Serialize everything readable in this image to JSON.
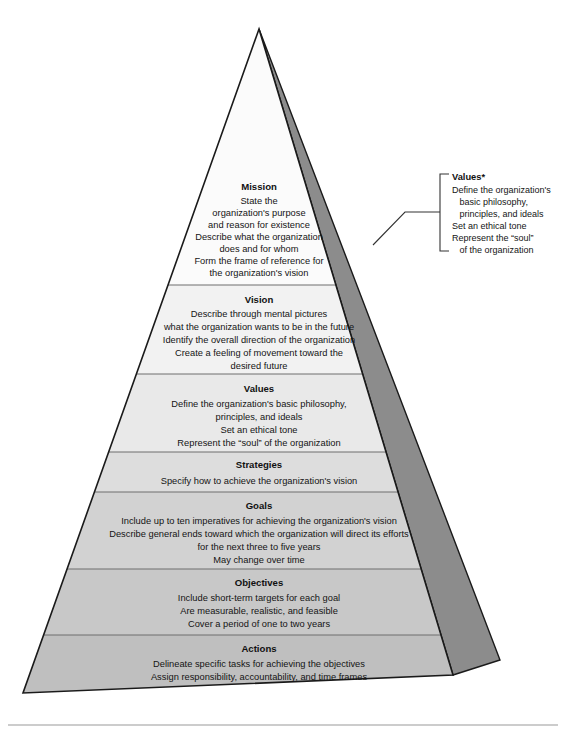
{
  "diagram": {
    "apex": "",
    "bands": [
      {
        "id": "mission",
        "title": "Mission",
        "lines": [
          "State the",
          "organization's purpose",
          "and reason for existence",
          "Describe what the organization",
          "does and for whom",
          "Form the frame of reference for",
          "the organization's vision"
        ],
        "fill": "#fbfbfb"
      },
      {
        "id": "vision",
        "title": "Vision",
        "lines": [
          "Describe through mental pictures",
          "what the organization wants to be in the future",
          "Identify the overall direction of the organization",
          "Create a feeling of movement toward the",
          "desired future"
        ],
        "fill": "#f2f2f2"
      },
      {
        "id": "values",
        "title": "Values",
        "lines": [
          "Define the organization's basic philosophy,",
          "principles, and ideals",
          "Set an ethical tone",
          "Represent the “soul” of the organization"
        ],
        "fill": "#e9e9e9"
      },
      {
        "id": "strategies",
        "title": "Strategies",
        "lines": [
          "Specify how to achieve the organization's vision"
        ],
        "fill": "#dddddd"
      },
      {
        "id": "goals",
        "title": "Goals",
        "lines": [
          "Include up to ten imperatives for achieving the organization's vision",
          "Describe general ends toward which the organization will direct its efforts",
          "for the next three to five years",
          "May change over time"
        ],
        "fill": "#d2d2d2"
      },
      {
        "id": "objectives",
        "title": "Objectives",
        "lines": [
          "Include short-term targets for each goal",
          "Are measurable, realistic, and feasible",
          "Cover a period of one to two years"
        ],
        "fill": "#c8c8c8"
      },
      {
        "id": "actions",
        "title": "Actions",
        "lines": [
          "Delineate specific tasks for achieving the objectives",
          "Assign responsibility, accountability, and time frames"
        ],
        "fill": "#bfbfbf"
      }
    ],
    "callout": {
      "title": "Values*",
      "lines": [
        "Define the organization's",
        "   basic philosophy,",
        "   principles, and ideals",
        "Set an ethical tone",
        "Represent the “soul”",
        "   of the organization"
      ]
    },
    "colors": {
      "side_face": "#8c8c8c",
      "outline": "#1a1a1a",
      "divider": "#6e6e6e",
      "rule": "#9a9a9a",
      "bracket": "#333333",
      "text": "#141414"
    }
  }
}
